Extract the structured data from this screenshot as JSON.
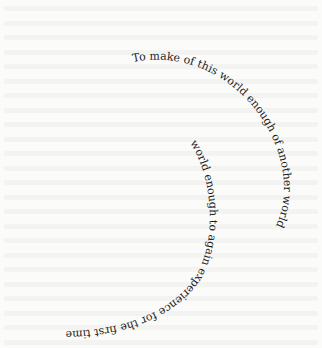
{
  "page": {
    "background_color": "#fbfbfa",
    "text_color": "#1c1c1c",
    "bleed_through_text": "illegible"
  },
  "spiral": {
    "outer_line": "To make of this world enough of another world",
    "inner_line": "world enough to again experience for the first time"
  }
}
